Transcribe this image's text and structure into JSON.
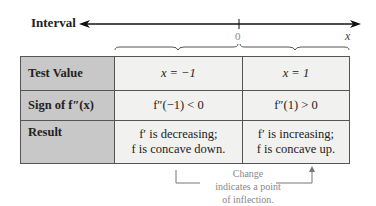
{
  "number_line": {
    "label": "Interval",
    "tick_label": "0",
    "axis_variable": "x"
  },
  "table": {
    "rows": [
      {
        "header": "Test Value",
        "cells": [
          "x = −1",
          "x = 1"
        ]
      },
      {
        "header": "Sign of f″(x)",
        "cells": [
          "f″(−1) < 0",
          "f″(1) > 0"
        ]
      },
      {
        "header": "Result",
        "cells": [
          [
            "f′ is decreasing;",
            "f is concave down."
          ],
          [
            "f′ is increasing;",
            "f is concave up."
          ]
        ]
      }
    ]
  },
  "annotation": {
    "lines": [
      "Change",
      "indicates a point",
      "of inflection."
    ]
  },
  "colors": {
    "header_bg": "#c8c8c8",
    "cell_bg": "#f1f1ef",
    "annotation": "#888888"
  }
}
